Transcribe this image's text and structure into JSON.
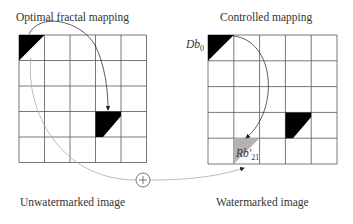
{
  "titles": {
    "left_top": "Optimal fractal mapping",
    "right_top": "Controlled mapping",
    "left_bottom": "Unwatermarked image",
    "right_bottom": "Watermarked image"
  },
  "labels": {
    "domain_block": "Db",
    "domain_block_sub": "0",
    "range_block": "Rb′",
    "range_block_sub": "21",
    "combine_symbol": "+"
  },
  "grids": {
    "rows": 5,
    "cols": 5,
    "left": {
      "x": 19,
      "y": 35,
      "cell": 25.5
    },
    "right": {
      "x": 208,
      "y": 35,
      "cell": 25.8
    }
  },
  "colors": {
    "block_fill": "#000000",
    "watermark_fill": "#b3b3b3",
    "grid_line": "#555555",
    "light_curve": "#aaaaaa",
    "dark_curve": "#333333"
  }
}
